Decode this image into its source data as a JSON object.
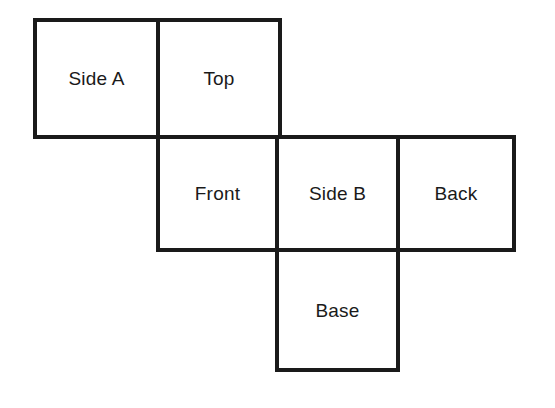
{
  "diagram": {
    "type": "cube-net",
    "background_color": "#ffffff",
    "stroke_color": "#1a1a1a",
    "text_color": "#1a1a1a",
    "stroke_width_px": 4,
    "canvas": {
      "width": 555,
      "height": 408
    },
    "grid": {
      "columns_x": [
        35,
        158,
        277,
        398,
        514
      ],
      "rows_y": [
        20,
        137,
        250,
        370
      ]
    },
    "faces": [
      {
        "id": "side-a",
        "label": "Side A",
        "row": "top",
        "column": 0,
        "x": 35,
        "y": 20,
        "width": 123,
        "height": 117
      },
      {
        "id": "top",
        "label": "Top",
        "row": "top",
        "column": 1,
        "x": 158,
        "y": 20,
        "width": 122,
        "height": 117
      },
      {
        "id": "front",
        "label": "Front",
        "row": "middle",
        "column": 1,
        "x": 158,
        "y": 137,
        "width": 119,
        "height": 113
      },
      {
        "id": "side-b",
        "label": "Side B",
        "row": "middle",
        "column": 2,
        "x": 277,
        "y": 137,
        "width": 121,
        "height": 113
      },
      {
        "id": "back",
        "label": "Back",
        "row": "middle",
        "column": 3,
        "x": 398,
        "y": 137,
        "width": 116,
        "height": 113
      },
      {
        "id": "base",
        "label": "Base",
        "row": "bottom",
        "column": 2,
        "x": 277,
        "y": 250,
        "width": 121,
        "height": 120
      }
    ]
  }
}
